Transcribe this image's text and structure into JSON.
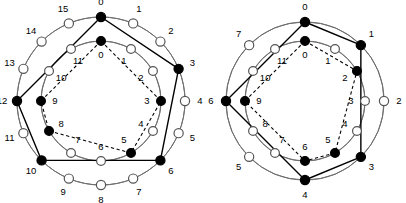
{
  "figure": {
    "background_color": "#ffffff",
    "stroke_color": "#000000",
    "guide_color": "#6e6e6e",
    "filled_node_color": "#000000",
    "open_node_color": "#ffffff",
    "node_radius_outer": 4.6,
    "node_radius_inner": 4.4,
    "label_font_size": 9.5
  },
  "chart_data": {
    "type": "diagram",
    "panels": [
      {
        "id": "left-panel",
        "name": "left-diagram",
        "center": {
          "x": 101,
          "y": 101
        },
        "rings": [
          {
            "id": "left-outer-ring",
            "name": "outer-ring",
            "radius": 84,
            "guide_radius": 84,
            "count": 16,
            "start_angle_deg": -90,
            "labels": [
              "0",
              "1",
              "2",
              "3",
              "4",
              "5",
              "6",
              "7",
              "8",
              "9",
              "10",
              "11",
              "12",
              "13",
              "14",
              "15"
            ],
            "label_offset": 15,
            "filled": [
              0,
              3,
              6,
              10,
              12
            ],
            "polygon_order": [
              0,
              3,
              6,
              10,
              12
            ],
            "polygon_style": "solid"
          },
          {
            "id": "left-inner-ring",
            "name": "inner-ring",
            "radius": 60,
            "guide_radius": 60,
            "count": 12,
            "start_angle_deg": -90,
            "labels": [
              "0",
              "1",
              "2",
              "3",
              "4",
              "5",
              "6",
              "7",
              "8",
              "9",
              "10",
              "11"
            ],
            "label_offset": -14,
            "filled": [
              0,
              3,
              5,
              8,
              9
            ],
            "polygon_order": [
              0,
              3,
              5,
              8,
              9
            ],
            "polygon_style": "dashed"
          }
        ]
      },
      {
        "id": "right-panel",
        "name": "right-diagram",
        "center": {
          "x": 305,
          "y": 101
        },
        "rings": [
          {
            "id": "right-outer-ring",
            "name": "outer-ring",
            "radius": 79,
            "guide_radius": 79,
            "count": 8,
            "start_angle_deg": -90,
            "labels": [
              "0",
              "1",
              "2",
              "3",
              "4",
              "5",
              "6",
              "7"
            ],
            "label_offset": 15,
            "filled": [
              0,
              1,
              3,
              4,
              6
            ],
            "polygon_order": [
              0,
              1,
              3,
              4,
              6
            ],
            "polygon_style": "solid"
          },
          {
            "id": "right-inner-ring",
            "name": "inner-ring",
            "radius": 60,
            "guide_radius": 60,
            "count": 12,
            "start_angle_deg": -90,
            "labels": [
              "0",
              "1",
              "2",
              "3",
              "4",
              "5",
              "6",
              "7",
              "8",
              "9",
              "10",
              "11"
            ],
            "label_offset": -14,
            "filled": [
              0,
              2,
              5,
              6,
              9
            ],
            "polygon_order": [
              0,
              2,
              5,
              6,
              9
            ],
            "polygon_style": "dashed"
          }
        ]
      }
    ]
  }
}
